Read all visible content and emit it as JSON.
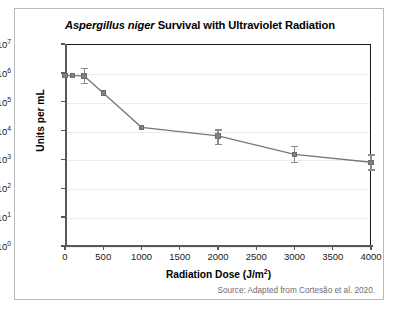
{
  "figure": {
    "title_italic": "Aspergillus niger",
    "title_rest": " Survival with Ultraviolet Radiation",
    "source": "Source: Adapted from Cortesão et al. 2020."
  },
  "chart_data": {
    "type": "line",
    "title": "Aspergillus niger Survival with Ultraviolet Radiation",
    "xlabel": "Radiation Dose (J/m²)",
    "ylabel": "Units per mL",
    "xlabel_base": "Radiation Dose (J/m",
    "xlabel_sup": "2",
    "xlabel_tail": ")",
    "yscale": "log",
    "xscale": "linear",
    "xlim": [
      0,
      4000
    ],
    "ylim": [
      1,
      10000000
    ],
    "grid": "horizontal",
    "legend": "none",
    "marker": "square",
    "series_color": "#808080",
    "line_color": "#777777",
    "x": [
      0,
      100,
      250,
      500,
      1000,
      2000,
      3000,
      4000
    ],
    "y": [
      800000,
      800000,
      780000,
      200000,
      13000,
      6500,
      1500,
      800
    ],
    "yerr_low": [
      0,
      0,
      330000,
      0,
      0,
      3000,
      700,
      350
    ],
    "yerr_high": [
      0,
      0,
      700000,
      0,
      0,
      4500,
      1400,
      700
    ],
    "xticks": [
      0,
      500,
      1000,
      1500,
      2000,
      2500,
      3000,
      3500,
      4000
    ],
    "xtick_labels": [
      "0",
      "500",
      "1000",
      "1500",
      "2000",
      "2500",
      "3000",
      "3500",
      "4000"
    ],
    "yticks": [
      1,
      10,
      100,
      1000,
      10000,
      100000,
      1000000,
      10000000
    ],
    "ytick_exponents": [
      "0",
      "1",
      "2",
      "3",
      "4",
      "5",
      "6",
      "7"
    ],
    "ytick_base": "10"
  }
}
